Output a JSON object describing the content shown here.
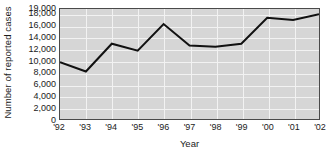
{
  "chart_data": {
    "type": "line",
    "title": "",
    "xlabel": "Year",
    "ylabel": "Number of reported cases",
    "categories": [
      "'92",
      "'93",
      "'94",
      "'95",
      "'96",
      "'97",
      "'98",
      "'99",
      "'00",
      "'01",
      "'02"
    ],
    "values": [
      9800,
      8200,
      13000,
      11800,
      16400,
      12700,
      12500,
      13000,
      17500,
      17100,
      18100
    ],
    "series": [
      {
        "name": "Reported cases",
        "values": [
          9800,
          8200,
          13000,
          11800,
          16400,
          12700,
          12500,
          13000,
          17500,
          17100,
          18100
        ]
      }
    ],
    "ylim": [
      0,
      19000
    ],
    "ytick_labels": [
      "19,000",
      "18,000",
      "16,000",
      "14,000",
      "12,000",
      "10,000",
      "8,000",
      "6,000",
      "4,000",
      "2,000",
      "0"
    ],
    "ytick_values": [
      19000,
      18000,
      16000,
      14000,
      12000,
      10000,
      8000,
      6000,
      4000,
      2000,
      0
    ],
    "xtick_labels": [
      "'92",
      "'93",
      "'94",
      "'95",
      "'96",
      "'97",
      "'98",
      "'99",
      "'00",
      "'01",
      "'02"
    ],
    "grid": true,
    "grid_color": "#f2f2f2",
    "legend": "none",
    "plot_background": "#d6d6d6",
    "line_color": "#111111",
    "axis_color": "#4a4a4a",
    "text_color": "#1b1b1b"
  }
}
